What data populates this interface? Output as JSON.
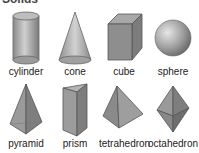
{
  "title_clipped": "Solids",
  "shapes": [
    {
      "name": "cylinder"
    },
    {
      "name": "cone"
    },
    {
      "name": "cube"
    },
    {
      "name": "sphere"
    },
    {
      "name": "pyramid"
    },
    {
      "name": "prism"
    },
    {
      "name": "tetrahedron"
    },
    {
      "name": "octahedron"
    }
  ],
  "colors": {
    "shape_fill": "#9a9a9a",
    "shape_light": "#c4c4c4",
    "shape_dark": "#6e6e6e",
    "edge": "#5a5a5a"
  }
}
